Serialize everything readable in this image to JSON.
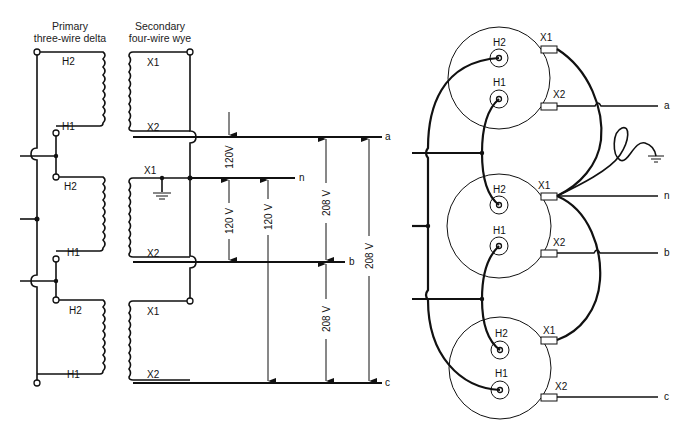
{
  "left_diagram": {
    "header_primary": [
      "Primary",
      "three-wire delta"
    ],
    "header_secondary": [
      "Secondary",
      "four-wire wye"
    ],
    "primary_terminals": [
      "H2",
      "H1",
      "H2",
      "H1",
      "H2",
      "H1"
    ],
    "secondary_terminals": [
      "X1",
      "X2",
      "X1",
      "X2",
      "X1",
      "X2"
    ],
    "lines": [
      "a",
      "n",
      "b",
      "c"
    ],
    "voltages": {
      "a_to_n": "120V",
      "n_to_b_1": "120 V",
      "n_to_c": "120 V",
      "a_to_b": "208 V",
      "b_to_c": "208 V",
      "a_to_c": "208 V"
    }
  },
  "right_diagram": {
    "transformers": [
      {
        "h_upper": "H2",
        "h_lower": "H1",
        "x_upper": "X1",
        "x_lower": "X2"
      },
      {
        "h_upper": "H2",
        "h_lower": "H1",
        "x_upper": "X1",
        "x_lower": "X2"
      },
      {
        "h_upper": "H2",
        "h_lower": "H1",
        "x_upper": "X1",
        "x_lower": "X2"
      }
    ],
    "lines": [
      "a",
      "n",
      "b",
      "c"
    ]
  },
  "icons": [
    "ground-symbol-icon"
  ]
}
